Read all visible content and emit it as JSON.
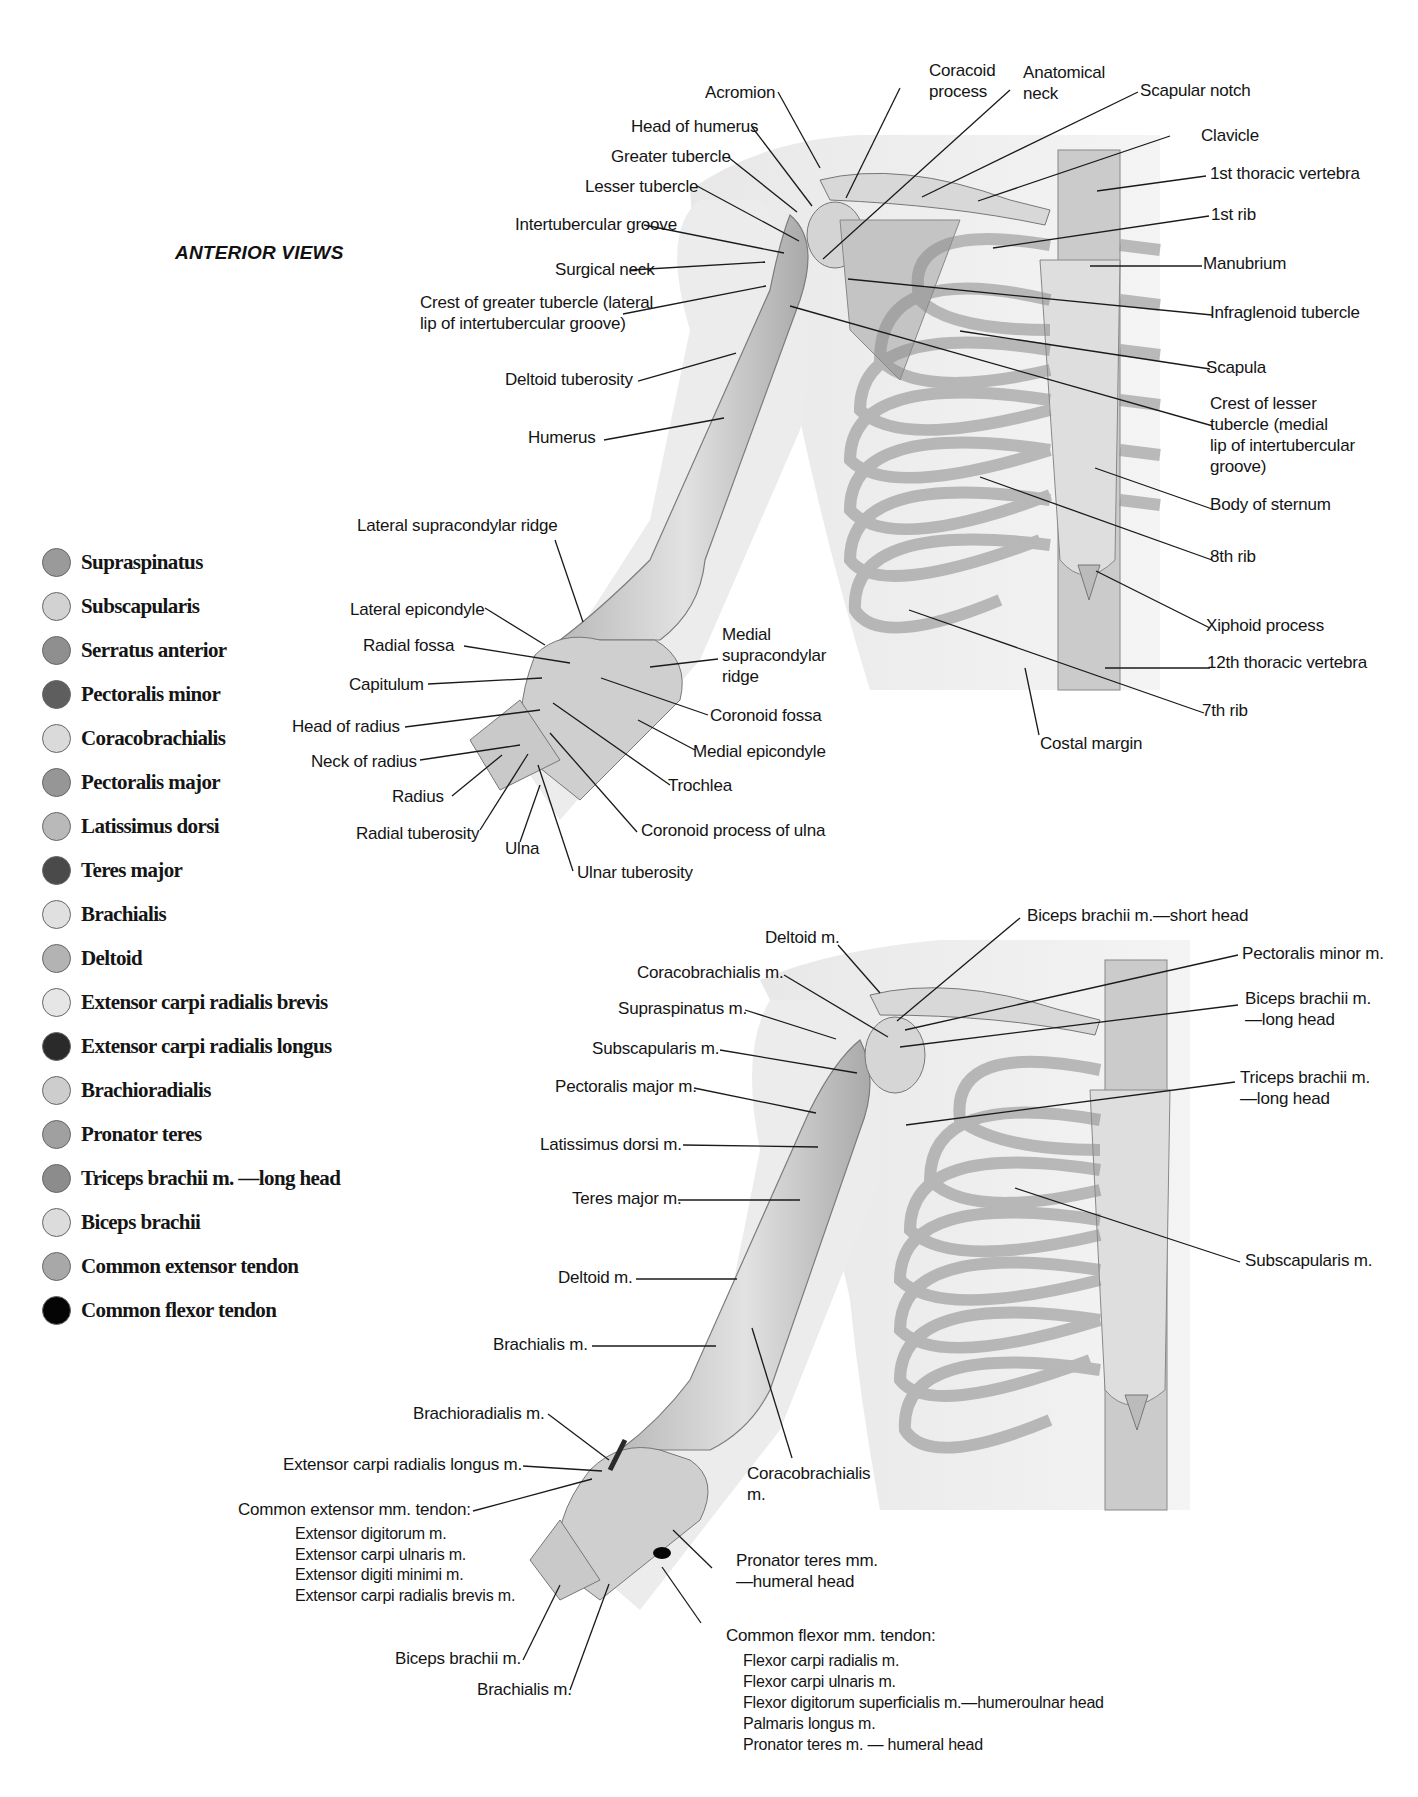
{
  "title": "ANTERIOR VIEWS",
  "legend": {
    "items": [
      {
        "label": "Supraspinatus",
        "color": "#9a9a9a"
      },
      {
        "label": "Subscapularis",
        "color": "#d2d2d2"
      },
      {
        "label": "Serratus anterior",
        "color": "#8f8f8f"
      },
      {
        "label": "Pectoralis minor",
        "color": "#5e5e5e"
      },
      {
        "label": "Coracobrachialis",
        "color": "#dadada"
      },
      {
        "label": "Pectoralis major",
        "color": "#969696"
      },
      {
        "label": "Latissimus dorsi",
        "color": "#b9b9b9"
      },
      {
        "label": "Teres major",
        "color": "#4a4a4a"
      },
      {
        "label": "Brachialis",
        "color": "#e0e0e0"
      },
      {
        "label": "Deltoid",
        "color": "#b3b3b3"
      },
      {
        "label": "Extensor carpi radialis brevis",
        "color": "#e6e6e6"
      },
      {
        "label": "Extensor carpi radialis longus",
        "color": "#2a2a2a"
      },
      {
        "label": "Brachioradialis",
        "color": "#cdcdcd"
      },
      {
        "label": "Pronator teres",
        "color": "#a0a0a0"
      },
      {
        "label": "Triceps brachii m. —long head",
        "color": "#8c8c8c"
      },
      {
        "label": "Biceps brachii",
        "color": "#dcdcdc"
      },
      {
        "label": "Common extensor tendon",
        "color": "#a8a8a8"
      },
      {
        "label": "Common flexor tendon",
        "color": "#050505"
      }
    ]
  },
  "upper_diagram": {
    "labels": {
      "acromion": "Acromion",
      "coracoid_process": "Coracoid\nprocess",
      "anatomical_neck": "Anatomical\nneck",
      "scapular_notch": "Scapular notch",
      "head_of_humerus": "Head of humerus",
      "greater_tubercle": "Greater tubercle",
      "lesser_tubercle": "Lesser tubercle",
      "intertubercular_groove": "Intertubercular groove",
      "surgical_neck": "Surgical neck",
      "crest_greater_tubercle": "Crest of greater tubercle (lateral\nlip of intertubercular groove)",
      "deltoid_tuberosity": "Deltoid tuberosity",
      "humerus": "Humerus",
      "clavicle": "Clavicle",
      "first_thoracic_vertebra": "1st thoracic vertebra",
      "first_rib": "1st rib",
      "manubrium": "Manubrium",
      "infraglenoid_tubercle": "Infraglenoid tubercle",
      "scapula": "Scapula",
      "crest_lesser_tubercle": "Crest of lesser\ntubercle (medial\nlip of intertubercular\ngroove)",
      "body_of_sternum": "Body of sternum",
      "eighth_rib": "8th rib",
      "xiphoid_process": "Xiphoid process",
      "twelfth_thoracic_vertebra": "12th thoracic vertebra",
      "seventh_rib": "7th rib",
      "costal_margin": "Costal margin",
      "lateral_supracondylar_ridge": "Lateral supracondylar ridge",
      "lateral_epicondyle": "Lateral epicondyle",
      "radial_fossa": "Radial fossa",
      "capitulum": "Capitulum",
      "head_of_radius": "Head of radius",
      "neck_of_radius": "Neck of radius",
      "radius": "Radius",
      "radial_tuberosity": "Radial tuberosity",
      "ulna": "Ulna",
      "ulnar_tuberosity": "Ulnar tuberosity",
      "medial_supracondylar_ridge": "Medial\nsupracondylar\nridge",
      "coronoid_fossa": "Coronoid fossa",
      "medial_epicondyle": "Medial epicondyle",
      "trochlea": "Trochlea",
      "coronoid_process_ulna": "Coronoid process of ulna"
    }
  },
  "lower_diagram": {
    "labels": {
      "deltoid_top": "Deltoid m.",
      "biceps_short_head": "Biceps brachii m.—short head",
      "coracobrachialis_top": "Coracobrachialis m.",
      "pectoralis_minor": "Pectoralis minor m.",
      "supraspinatus": "Supraspinatus m.",
      "biceps_long_head": "Biceps brachii m.\n—long head",
      "subscapularis_left": "Subscapularis m.",
      "pectoralis_major": "Pectoralis major m.",
      "triceps_long_head": "Triceps brachii m.\n—long head",
      "latissimus_dorsi": "Latissimus dorsi m.",
      "teres_major": "Teres major m.",
      "subscapularis_right": "Subscapularis m.",
      "deltoid_arm": "Deltoid m.",
      "brachialis_arm": "Brachialis m.",
      "brachioradialis": "Brachioradialis m.",
      "ecrl": "Extensor carpi radialis longus m.",
      "common_extensor": "Common extensor mm. tendon:",
      "common_extensor_list": "Extensor digitorum m.\nExtensor carpi ulnaris m.\nExtensor digiti minimi m.\nExtensor carpi radialis brevis m.",
      "coracobrachialis_arm": "Coracobrachialis\nm.",
      "pronator_teres": "Pronator teres mm.\n—humeral head",
      "biceps_brachii": "Biceps brachii m.",
      "brachialis_forearm": "Brachialis m.",
      "common_flexor": "Common flexor mm. tendon:",
      "common_flexor_list": "Flexor carpi radialis m.\nFlexor carpi ulnaris m.\nFlexor digitorum superficialis m.—humeroulnar head\nPalmaris longus m.\nPronator teres m. — humeral head"
    }
  }
}
